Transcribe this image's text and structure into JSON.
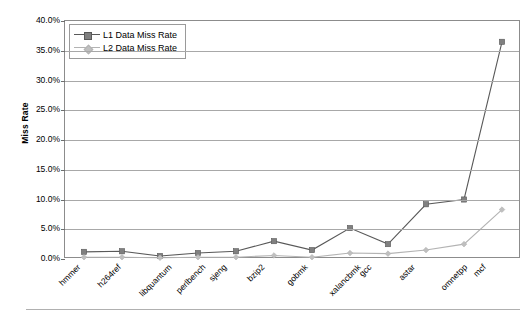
{
  "chart_data": {
    "type": "line",
    "title": "",
    "xlabel": "",
    "ylabel": "Miss Rate",
    "ylim": [
      0,
      40
    ],
    "ytick_values": [
      0,
      5,
      10,
      15,
      20,
      25,
      30,
      35,
      40
    ],
    "ytick_labels": [
      "0.0%",
      "5.0%",
      "10.0%",
      "15.0%",
      "20.0%",
      "25.0%",
      "30.0%",
      "35.0%",
      "40.0%"
    ],
    "grid": "horizontal",
    "legend_position": "top-left-inside",
    "categories": [
      "hmmer",
      "h264ref",
      "libquantum",
      "perlbench",
      "sjeng",
      "bzip2",
      "gobmk",
      "xalancbmk",
      "gcc",
      "astar",
      "omnetpp",
      "mcf"
    ],
    "series": [
      {
        "name": "L1 Data Miss Rate",
        "color": "#808080",
        "line_color": "#595959",
        "marker": "square",
        "values": [
          1.2,
          1.3,
          0.5,
          1.0,
          1.3,
          3.0,
          1.5,
          5.2,
          2.5,
          9.2,
          10.0,
          36.5
        ]
      },
      {
        "name": "L2 Data Miss Rate",
        "color": "#bfbfbf",
        "line_color": "#b3b3b3",
        "marker": "diamond",
        "values": [
          0.3,
          0.3,
          0.2,
          0.3,
          0.3,
          0.6,
          0.3,
          1.0,
          0.9,
          1.5,
          2.5,
          8.3
        ]
      }
    ]
  },
  "legend": {
    "items": [
      {
        "label": "L1 Data Miss Rate"
      },
      {
        "label": "L2 Data Miss Rate"
      }
    ]
  },
  "axis": {
    "y_title": "Miss Rate"
  },
  "colors": {
    "series1": "#808080",
    "series1_line": "#595959",
    "series2": "#bfbfbf",
    "series2_line": "#b3b3b3",
    "grid": "#a8a8a8",
    "frame": "#8c8c8c",
    "text": "#000000"
  }
}
